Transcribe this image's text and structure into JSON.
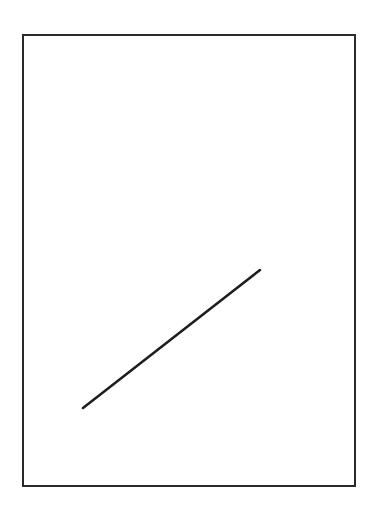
{
  "canvas": {
    "width": 382,
    "height": 514,
    "background": "#ffffff"
  },
  "frame": {
    "x": 23,
    "y": 35,
    "width": 332,
    "height": 451,
    "stroke": "#2a2a2a",
    "stroke_width": 2
  },
  "segment": {
    "x1": 83,
    "y1": 408,
    "x2": 260,
    "y2": 270,
    "stroke": "#1e1e1e",
    "stroke_width": 2.5
  }
}
